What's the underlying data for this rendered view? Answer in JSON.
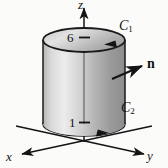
{
  "figure": {
    "background_color": "#fbfbfa",
    "ink_color": "#111111"
  },
  "axes": {
    "z": {
      "label": "z",
      "icon": "arrow-up-icon",
      "direction": "up"
    },
    "x": {
      "label": "x",
      "icon": "arrow-left-down-icon",
      "direction": "front-left"
    },
    "y": {
      "label": "y",
      "icon": "arrow-right-down-icon",
      "direction": "front-right"
    },
    "origin_note": "axes meet below the lower cylinder face"
  },
  "solid": {
    "name": "cylinder",
    "shading": {
      "body_light": "#e9e9e9",
      "body_mid": "#c9c9c9",
      "body_dark": "#8f8f8f",
      "top_light": "#dcdcdc",
      "top_dark": "#a3a3a3",
      "outline": "#1a1a1a"
    }
  },
  "curves": [
    {
      "label": "C",
      "subscript": "1",
      "position": "top rim",
      "orientation_icon": "arrowhead-ccw-icon",
      "height_value": "6"
    },
    {
      "label": "C",
      "subscript": "2",
      "position": "bottom rim",
      "orientation_icon": "arrowhead-ccw-icon",
      "height_value": "1"
    }
  ],
  "ticks": {
    "upper": {
      "value": "6",
      "icon": "tick-mark-icon",
      "on_axis": "z"
    },
    "lower": {
      "value": "1",
      "icon": "tick-mark-icon",
      "on_axis": "z"
    }
  },
  "normal": {
    "label": "n",
    "icon": "normal-vector-arrow-icon",
    "description": "outward pointing unit normal on the lateral surface"
  }
}
